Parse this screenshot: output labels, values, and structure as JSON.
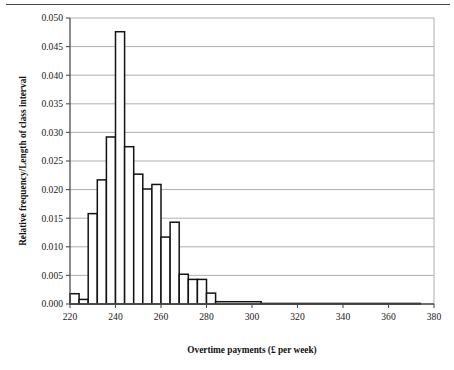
{
  "page": {
    "header_rule": "horizontal-rule"
  },
  "chart_data": {
    "type": "bar",
    "title": "",
    "subtitle": "",
    "xlabel": "Overtime payments (£ per week)",
    "ylabel": "Relative frequency/Length of class interval",
    "xlim": [
      220,
      380
    ],
    "ylim": [
      0,
      0.05
    ],
    "grid": true,
    "legend": null,
    "legend_position": "none",
    "x_tick_labels": [
      "220",
      "240",
      "260",
      "280",
      "300",
      "320",
      "340",
      "360",
      "380"
    ],
    "x_ticks": [
      220,
      240,
      260,
      280,
      300,
      320,
      340,
      360,
      380
    ],
    "y_tick_labels": [
      "0.000",
      "0.005",
      "0.010",
      "0.015",
      "0.020",
      "0.025",
      "0.030",
      "0.035",
      "0.040",
      "0.045",
      "0.050"
    ],
    "y_ticks": [
      0.0,
      0.005,
      0.01,
      0.015,
      0.02,
      0.025,
      0.03,
      0.035,
      0.04,
      0.045,
      0.05
    ],
    "bin_edges": [
      220,
      224,
      228,
      232,
      236,
      240,
      244,
      248,
      252,
      256,
      260,
      264,
      268,
      272,
      276,
      280,
      284,
      304,
      374
    ],
    "values": [
      0.0018,
      0.0008,
      0.0158,
      0.0217,
      0.0292,
      0.0476,
      0.0275,
      0.0227,
      0.0201,
      0.0209,
      0.0117,
      0.0143,
      0.0052,
      0.0043,
      0.0043,
      0.0019,
      0.0004,
      0.0001
    ],
    "bars": [
      {
        "x0": 220,
        "x1": 224,
        "value": 0.0018
      },
      {
        "x0": 224,
        "x1": 228,
        "value": 0.0008
      },
      {
        "x0": 228,
        "x1": 232,
        "value": 0.0158
      },
      {
        "x0": 232,
        "x1": 236,
        "value": 0.0217
      },
      {
        "x0": 236,
        "x1": 240,
        "value": 0.0292
      },
      {
        "x0": 240,
        "x1": 244,
        "value": 0.0476
      },
      {
        "x0": 244,
        "x1": 248,
        "value": 0.0275
      },
      {
        "x0": 248,
        "x1": 252,
        "value": 0.0227
      },
      {
        "x0": 252,
        "x1": 256,
        "value": 0.0201
      },
      {
        "x0": 256,
        "x1": 260,
        "value": 0.0209
      },
      {
        "x0": 260,
        "x1": 264,
        "value": 0.0117
      },
      {
        "x0": 264,
        "x1": 268,
        "value": 0.0143
      },
      {
        "x0": 268,
        "x1": 272,
        "value": 0.0052
      },
      {
        "x0": 272,
        "x1": 276,
        "value": 0.0043
      },
      {
        "x0": 276,
        "x1": 280,
        "value": 0.0043
      },
      {
        "x0": 280,
        "x1": 284,
        "value": 0.0019
      },
      {
        "x0": 284,
        "x1": 304,
        "value": 0.0004
      },
      {
        "x0": 304,
        "x1": 374,
        "value": 0.0001
      }
    ]
  }
}
